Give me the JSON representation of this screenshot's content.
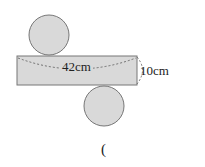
{
  "diagram": {
    "width_label": "42cm",
    "height_label": "10cm",
    "answer_bracket": "(",
    "colors": {
      "fill": "#d9d9d9",
      "stroke": "#666666"
    }
  }
}
